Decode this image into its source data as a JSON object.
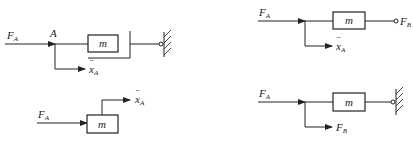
{
  "diagram": {
    "panels": [
      {
        "id": "top-left",
        "input_label": "F",
        "input_sub": "A",
        "node_label": "A",
        "block_label": "m",
        "output_label": "x",
        "output_sub": "A",
        "output_dots": "¨",
        "termination": "wall"
      },
      {
        "id": "top-right",
        "input_label": "F",
        "input_sub": "A",
        "block_label": "m",
        "output_label": "x",
        "output_sub": "A",
        "output_dots": "¨",
        "end_label": "F",
        "end_sub": "B",
        "termination": "open-terminal"
      },
      {
        "id": "bottom-left",
        "input_label": "F",
        "input_sub": "A",
        "block_label": "m",
        "output_label": "x",
        "output_sub": "A",
        "output_dots": "¨"
      },
      {
        "id": "bottom-right",
        "input_label": "F",
        "input_sub": "A",
        "block_label": "m",
        "output_label": "F",
        "output_sub": "B",
        "termination": "wall"
      }
    ]
  },
  "colors": {
    "line": "#222222",
    "background": "#ffffff"
  }
}
